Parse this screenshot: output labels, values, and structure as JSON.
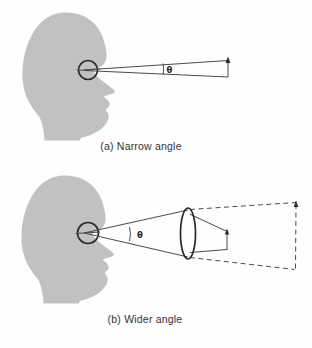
{
  "figure": {
    "panel_a": {
      "caption": "(a) Narrow angle",
      "angle_label": "θ"
    },
    "panel_b": {
      "caption": "(b) Wider angle",
      "angle_label": "θ"
    },
    "colors": {
      "head_fill": "#c1c1c1",
      "line": "#4a4a4a",
      "ink_strong": "#2a2a2a",
      "text_color": "#333333",
      "background": "#fefefe"
    }
  }
}
